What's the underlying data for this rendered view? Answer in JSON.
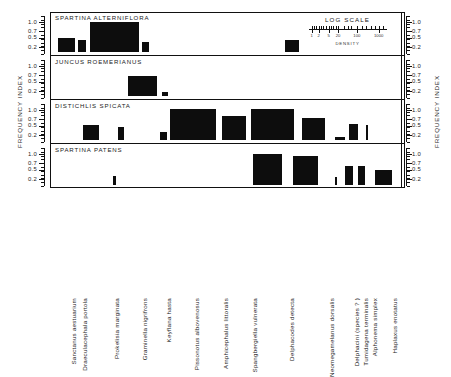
{
  "axes": {
    "left_title": "FREQUENCY INDEX",
    "right_title": "FREQUENCY INDEX",
    "tick_labels": [
      "1.0",
      "0.7",
      "0.5",
      "0.2"
    ],
    "tick_values": [
      1.0,
      0.7,
      0.5,
      0.2
    ]
  },
  "legend": {
    "title": "LOG SCALE",
    "density_label": "DENSITY",
    "tick_labels": [
      "1",
      "2",
      "5",
      "20",
      "100",
      "1000"
    ]
  },
  "chart_data": {
    "type": "bar",
    "title": "",
    "xlabel": "",
    "ylabel": "FREQUENCY INDEX",
    "ylim": [
      0.0,
      1.0
    ],
    "grid": false,
    "legend_position": "top-right",
    "note": "Four stacked host-plant panels; bar height = frequency index, bar width = log density of the insect species on that host plant.",
    "categories": [
      "Sanctanus aestuarium",
      "Draeculacephala portola",
      "Prokelisia marginata",
      "Graminella nigrifrons",
      "Keyflana hasta",
      "Pissonotus albovenosus",
      "Amphicephalus littoralis",
      "Spangbergiella vulnerata",
      "Delphacodes detecta",
      "Neomegamelanus dorsalis",
      "Delphacini (species ?)",
      "Tumidagena terminalis",
      "Alphonema simplex",
      "Haplaxus enotatus"
    ],
    "series": [
      {
        "name": "SPARTINA ALTERNIFLORA",
        "values": [
          0.46,
          0.4,
          0.98,
          0.0,
          0.33,
          0.0,
          0.0,
          0.0,
          0.4,
          0.0,
          0.0,
          0.0,
          0.0,
          0.0
        ]
      },
      {
        "name": "JUNCUS ROEMERIANUS",
        "values": [
          0.0,
          0.0,
          0.0,
          0.66,
          0.13,
          0.0,
          0.0,
          0.0,
          0.0,
          0.0,
          0.0,
          0.0,
          0.0,
          0.0
        ]
      },
      {
        "name": "DISTICHLIS SPICATA",
        "values": [
          0.0,
          0.47,
          0.0,
          0.42,
          0.0,
          0.25,
          1.0,
          0.77,
          1.0,
          0.72,
          0.1,
          0.52,
          0.47,
          0.0
        ]
      },
      {
        "name": "SPARTINA PATENS",
        "values": [
          0.0,
          0.0,
          0.3,
          0.0,
          0.0,
          0.0,
          0.0,
          0.0,
          1.0,
          0.95,
          0.25,
          0.6,
          0.6,
          0.5
        ]
      }
    ]
  },
  "panels": [
    {
      "title": "SPARTINA ALTERNIFLORA",
      "bars": [
        {
          "species": "Sanctanus aestuarium",
          "value": 0.46,
          "left": 8,
          "width": 17
        },
        {
          "species": "Draeculacephala portola",
          "value": 0.4,
          "left": 28,
          "width": 8
        },
        {
          "species": "Prokelisia marginata",
          "value": 0.98,
          "left": 40,
          "width": 49
        },
        {
          "species": "Keyflana hasta",
          "value": 0.33,
          "left": 92,
          "width": 7
        },
        {
          "species": "Delphacodes detecta",
          "value": 0.4,
          "left": 235,
          "width": 14
        }
      ]
    },
    {
      "title": "JUNCUS ROEMERIANUS",
      "bars": [
        {
          "species": "Graminella nigrifrons",
          "value": 0.66,
          "left": 78,
          "width": 29
        },
        {
          "species": "Keyflana hasta",
          "value": 0.13,
          "left": 112,
          "width": 6
        }
      ]
    },
    {
      "title": "DISTICHLIS SPICATA",
      "bars": [
        {
          "species": "Draeculacephala portola",
          "value": 0.47,
          "left": 33,
          "width": 16
        },
        {
          "species": "Graminella nigrifrons",
          "value": 0.42,
          "left": 68,
          "width": 6
        },
        {
          "species": "Pissonotus albovenosus",
          "value": 0.25,
          "left": 110,
          "width": 7
        },
        {
          "species": "Amphicephalus littoralis",
          "value": 1.0,
          "left": 120,
          "width": 46
        },
        {
          "species": "Spangbergiella vulnerata",
          "value": 0.77,
          "left": 172,
          "width": 24
        },
        {
          "species": "Delphacodes detecta",
          "value": 1.0,
          "left": 201,
          "width": 43
        },
        {
          "species": "Neomegamelanus dorsalis",
          "value": 0.72,
          "left": 252,
          "width": 23
        },
        {
          "species": "Delphacini (species ?)",
          "value": 0.1,
          "left": 285,
          "width": 10
        },
        {
          "species": "Tumidagena terminalis",
          "value": 0.52,
          "left": 299,
          "width": 9
        },
        {
          "species": "Alphonema simplex",
          "value": 0.47,
          "left": 316,
          "width": 2
        }
      ]
    },
    {
      "title": "SPARTINA PATENS",
      "bars": [
        {
          "species": "Prokelisia marginata",
          "value": 0.3,
          "left": 63,
          "width": 3
        },
        {
          "species": "Delphacodes detecta",
          "value": 1.0,
          "left": 203,
          "width": 29
        },
        {
          "species": "Neomegamelanus dorsalis",
          "value": 0.95,
          "left": 243,
          "width": 25
        },
        {
          "species": "Delphacini (species ?)",
          "value": 0.25,
          "left": 285,
          "width": 2
        },
        {
          "species": "Tumidagena terminalis",
          "value": 0.6,
          "left": 295,
          "width": 8
        },
        {
          "species": "Alphonema simplex",
          "value": 0.6,
          "left": 308,
          "width": 7
        },
        {
          "species": "Haplaxus enotatus",
          "value": 0.5,
          "left": 325,
          "width": 17
        }
      ]
    }
  ],
  "species_labels": [
    {
      "name": "Sanctanus aestuarium",
      "x": 20
    },
    {
      "name": "Draeculacephala portola",
      "x": 31
    },
    {
      "name": "Prokelisia marginata",
      "x": 63
    },
    {
      "name": "Graminella nigrifrons",
      "x": 91
    },
    {
      "name": "Keyflana hasta",
      "x": 115
    },
    {
      "name": "Pissonotus albovenosus",
      "x": 143
    },
    {
      "name": "Amphicephalus littoralis",
      "x": 172
    },
    {
      "name": "Spangbergiella vulnerata",
      "x": 201
    },
    {
      "name": "Delphacodes detecta",
      "x": 238
    },
    {
      "name": "Neomegamelanus dorsalis",
      "x": 278
    },
    {
      "name": "Delphacini (species ? )",
      "x": 303
    },
    {
      "name": "Tumidagena terminalis",
      "x": 312
    },
    {
      "name": "Alphonema simplex",
      "x": 321
    },
    {
      "name": "Haplaxus enotatus",
      "x": 341
    }
  ]
}
